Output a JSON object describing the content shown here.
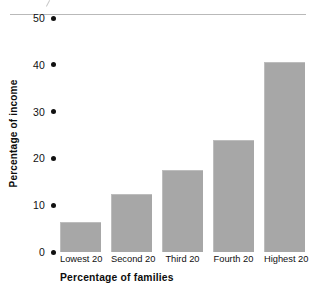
{
  "chart_data": {
    "type": "bar",
    "title": "",
    "categories": [
      "Lowest 20",
      "Second 20",
      "Third 20",
      "Fourth 20",
      "Highest 20"
    ],
    "values": [
      6.5,
      12.5,
      17.5,
      24,
      40.5
    ],
    "xlabel": "Percentage of families",
    "ylabel": "Percentage of income",
    "ylim": [
      0,
      50
    ],
    "yticks": [
      0,
      10,
      20,
      30,
      40,
      50
    ],
    "ytick_labels": [
      "0",
      "10",
      "20",
      "30",
      "40",
      "50"
    ],
    "grid": false,
    "legend": null,
    "bar_color": "#a7a7a7",
    "tick_marker": "dot"
  }
}
